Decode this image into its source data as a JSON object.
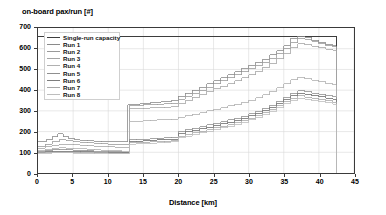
{
  "chart_data": {
    "type": "line",
    "title": "",
    "ylabel": "on-board pax/run [#]",
    "xlabel": "Distance [km]",
    "xlim": [
      0,
      45
    ],
    "ylim": [
      0,
      700
    ],
    "xticks": [
      0,
      5,
      10,
      15,
      20,
      25,
      30,
      35,
      40,
      45
    ],
    "yticks": [
      0,
      100,
      200,
      300,
      400,
      500,
      600,
      700
    ],
    "grid": true,
    "legend_position": "upper-left",
    "step_style": "post",
    "series": [
      {
        "name": "Single-run capacity",
        "color": "#3d3d3d",
        "width": 1.5,
        "x": [
          0,
          42.5,
          42.5
        ],
        "y": [
          660,
          660,
          0
        ]
      },
      {
        "name": "Run 1",
        "color": "#8a8a8a",
        "width": 0.8,
        "x": [
          0,
          1.2,
          2.0,
          2.8,
          3.6,
          4.4,
          5.2,
          6.0,
          7.0,
          8.0,
          9.0,
          10.0,
          11.0,
          12.0,
          12.8,
          13.6,
          14.5,
          16.0,
          17.5,
          19.0,
          20.0,
          21.0,
          22.0,
          23.0,
          24.0,
          25.0,
          26.0,
          27.0,
          28.0,
          29.0,
          30.0,
          31.0,
          32.0,
          33.0,
          34.0,
          35.0,
          36.0,
          37.0,
          38.0,
          39.0,
          40.0,
          41.0,
          42.0,
          42.5
        ],
        "y": [
          150,
          160,
          175,
          190,
          175,
          165,
          160,
          158,
          156,
          154,
          152,
          150,
          150,
          150,
          330,
          330,
          335,
          340,
          345,
          350,
          370,
          385,
          400,
          415,
          430,
          445,
          460,
          475,
          490,
          505,
          520,
          535,
          550,
          570,
          590,
          615,
          650,
          660,
          655,
          640,
          630,
          620,
          615,
          0
        ]
      },
      {
        "name": "Run 2",
        "color": "#9a9a9a",
        "width": 0.8,
        "x": [
          0,
          1.0,
          2.0,
          3.0,
          4.0,
          5.0,
          6.0,
          7.0,
          8.0,
          9.0,
          10.0,
          11.0,
          12.0,
          13.0,
          14.0,
          15.0,
          16.0,
          17.0,
          18.0,
          19.0,
          20.0,
          21.0,
          22.0,
          23.0,
          24.0,
          25.0,
          26.0,
          27.0,
          28.0,
          29.0,
          30.0,
          31.0,
          32.0,
          33.0,
          34.0,
          35.0,
          36.0,
          37.0,
          38.0,
          39.0,
          40.0,
          41.0,
          42.0,
          42.5
        ],
        "y": [
          130,
          140,
          150,
          160,
          155,
          150,
          148,
          146,
          144,
          142,
          140,
          140,
          140,
          325,
          325,
          330,
          330,
          332,
          334,
          336,
          355,
          370,
          385,
          400,
          415,
          430,
          445,
          460,
          475,
          490,
          505,
          520,
          535,
          555,
          575,
          600,
          630,
          650,
          645,
          635,
          625,
          615,
          610,
          0
        ]
      },
      {
        "name": "Run 3",
        "color": "#a5a5a5",
        "width": 0.8,
        "x": [
          0,
          1.0,
          2.0,
          3.0,
          4.0,
          5.0,
          6.0,
          7.0,
          8.0,
          9.0,
          10.0,
          11.0,
          12.0,
          13.0,
          14.0,
          15.0,
          16.0,
          17.0,
          18.0,
          19.0,
          20.0,
          21.0,
          22.0,
          23.0,
          24.0,
          25.0,
          26.0,
          27.0,
          28.0,
          29.0,
          30.0,
          31.0,
          32.0,
          33.0,
          34.0,
          35.0,
          36.0,
          37.0,
          38.0,
          39.0,
          40.0,
          41.0,
          42.0,
          42.5
        ],
        "y": [
          120,
          128,
          135,
          140,
          138,
          136,
          134,
          132,
          130,
          128,
          126,
          125,
          125,
          310,
          310,
          312,
          314,
          316,
          318,
          320,
          335,
          350,
          365,
          380,
          395,
          408,
          420,
          432,
          445,
          460,
          475,
          492,
          510,
          530,
          552,
          578,
          605,
          625,
          620,
          612,
          605,
          598,
          592,
          0
        ]
      },
      {
        "name": "Run 4",
        "color": "#b0b0b0",
        "width": 0.8,
        "x": [
          0,
          1.0,
          2.0,
          3.0,
          4.0,
          5.0,
          6.0,
          7.0,
          8.0,
          9.0,
          10.0,
          11.0,
          12.0,
          13.0,
          14.0,
          15.0,
          16.0,
          17.0,
          18.0,
          19.0,
          20.0,
          21.0,
          22.0,
          23.0,
          24.0,
          25.0,
          26.0,
          27.0,
          28.0,
          29.0,
          30.0,
          31.0,
          32.0,
          33.0,
          34.0,
          35.0,
          36.0,
          37.0,
          38.0,
          39.0,
          40.0,
          41.0,
          42.0,
          42.5
        ],
        "y": [
          110,
          115,
          120,
          122,
          120,
          118,
          116,
          114,
          112,
          110,
          108,
          107,
          106,
          250,
          250,
          252,
          254,
          256,
          258,
          260,
          268,
          276,
          284,
          292,
          300,
          308,
          316,
          324,
          332,
          342,
          352,
          364,
          378,
          394,
          412,
          432,
          450,
          462,
          455,
          448,
          440,
          432,
          425,
          0
        ]
      },
      {
        "name": "Run 5",
        "color": "#8f8f8f",
        "width": 0.8,
        "x": [
          0,
          1.0,
          2.0,
          3.0,
          4.0,
          5.0,
          6.0,
          7.0,
          8.0,
          9.0,
          10.0,
          11.0,
          12.0,
          13.0,
          14.0,
          15.0,
          16.0,
          17.0,
          18.0,
          19.0,
          20.0,
          21.0,
          22.0,
          23.0,
          24.0,
          25.0,
          26.0,
          27.0,
          28.0,
          29.0,
          30.0,
          31.0,
          32.0,
          33.0,
          34.0,
          35.0,
          36.0,
          37.0,
          38.0,
          39.0,
          40.0,
          41.0,
          42.0,
          42.5
        ],
        "y": [
          105,
          108,
          112,
          115,
          113,
          111,
          109,
          107,
          105,
          104,
          103,
          102,
          101,
          160,
          162,
          164,
          166,
          168,
          170,
          172,
          200,
          208,
          216,
          224,
          232,
          240,
          248,
          256,
          265,
          275,
          286,
          298,
          312,
          328,
          346,
          366,
          385,
          398,
          392,
          386,
          380,
          374,
          368,
          0
        ]
      },
      {
        "name": "Run 6",
        "color": "#7d7d7d",
        "width": 0.9,
        "x": [
          0,
          1.0,
          2.0,
          3.0,
          4.0,
          5.0,
          6.0,
          7.0,
          8.0,
          9.0,
          10.0,
          11.0,
          12.0,
          13.0,
          14.0,
          15.0,
          16.0,
          17.0,
          18.0,
          19.0,
          20.0,
          21.0,
          22.0,
          23.0,
          24.0,
          25.0,
          26.0,
          27.0,
          28.0,
          29.0,
          30.0,
          31.0,
          32.0,
          33.0,
          34.0,
          35.0,
          36.0,
          37.0,
          38.0,
          39.0,
          40.0,
          41.0,
          42.0,
          42.5
        ],
        "y": [
          100,
          102,
          104,
          106,
          105,
          104,
          103,
          102,
          101,
          100,
          100,
          100,
          100,
          152,
          154,
          156,
          158,
          160,
          162,
          164,
          190,
          198,
          206,
          214,
          222,
          230,
          238,
          246,
          255,
          265,
          276,
          288,
          302,
          318,
          336,
          356,
          374,
          386,
          380,
          374,
          368,
          362,
          356,
          0
        ]
      },
      {
        "name": "Run 7",
        "color": "#a8a8a8",
        "width": 0.8,
        "x": [
          0,
          1.0,
          2.0,
          3.0,
          4.0,
          5.0,
          6.0,
          7.0,
          8.0,
          9.0,
          10.0,
          11.0,
          12.0,
          13.0,
          14.0,
          15.0,
          16.0,
          17.0,
          18.0,
          19.0,
          20.0,
          21.0,
          22.0,
          23.0,
          24.0,
          25.0,
          26.0,
          27.0,
          28.0,
          29.0,
          30.0,
          31.0,
          32.0,
          33.0,
          34.0,
          35.0,
          36.0,
          37.0,
          38.0,
          39.0,
          40.0,
          41.0,
          42.0,
          42.5
        ],
        "y": [
          98,
          99,
          100,
          101,
          100,
          99,
          98,
          98,
          97,
          97,
          96,
          96,
          96,
          145,
          146,
          148,
          150,
          152,
          154,
          156,
          178,
          186,
          194,
          202,
          210,
          218,
          226,
          234,
          243,
          253,
          264,
          276,
          290,
          306,
          324,
          344,
          360,
          372,
          366,
          360,
          354,
          348,
          342,
          0
        ]
      },
      {
        "name": "Run 8",
        "color": "#bdbdbd",
        "width": 0.8,
        "x": [
          0,
          1.0,
          2.0,
          3.0,
          4.0,
          5.0,
          6.0,
          7.0,
          8.0,
          9.0,
          10.0,
          11.0,
          12.0,
          13.0,
          14.0,
          15.0,
          16.0,
          17.0,
          18.0,
          19.0,
          20.0,
          21.0,
          22.0,
          23.0,
          24.0,
          25.0,
          26.0,
          27.0,
          28.0,
          29.0,
          30.0,
          31.0,
          32.0,
          33.0,
          34.0,
          35.0,
          36.0,
          37.0,
          38.0,
          39.0,
          40.0,
          41.0,
          42.0,
          42.5
        ],
        "y": [
          95,
          96,
          97,
          98,
          97,
          96,
          95,
          95,
          94,
          94,
          93,
          93,
          93,
          140,
          141,
          142,
          144,
          146,
          148,
          150,
          170,
          178,
          186,
          194,
          202,
          210,
          218,
          226,
          235,
          245,
          256,
          268,
          282,
          298,
          316,
          336,
          352,
          362,
          356,
          350,
          344,
          338,
          332,
          0
        ]
      }
    ]
  },
  "legend": {
    "items": [
      {
        "label": "Single-run capacity"
      },
      {
        "label": "Run 1"
      },
      {
        "label": "Run 2"
      },
      {
        "label": "Run 3"
      },
      {
        "label": "Run 4"
      },
      {
        "label": "Run 5"
      },
      {
        "label": "Run 6"
      },
      {
        "label": "Run 7"
      },
      {
        "label": "Run 8"
      }
    ]
  },
  "style": {
    "grid_color": "#d9d9d9",
    "axis_color": "#3a3a3a",
    "background": "#ffffff"
  }
}
